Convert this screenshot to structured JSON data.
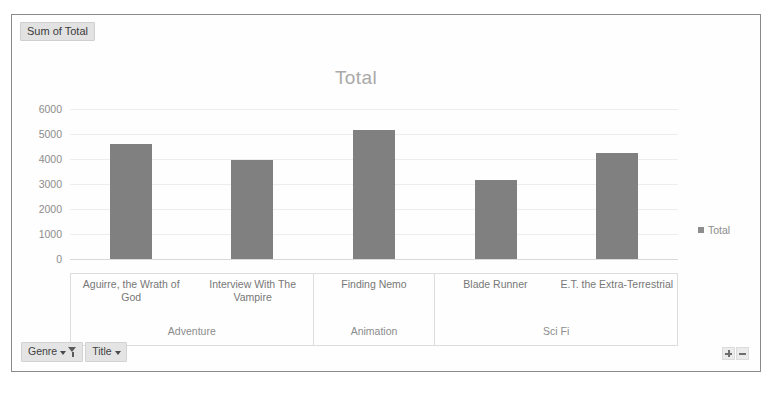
{
  "value_field_button": {
    "label": "Sum of Total"
  },
  "chart": {
    "title": "Total",
    "legend": {
      "entry": "Total",
      "marker_color": "#8d8d8d",
      "position": "right"
    }
  },
  "field_buttons": [
    {
      "label": "Genre",
      "has_caret": true,
      "has_filter": true,
      "icons": [
        "chevron-down-icon",
        "filter-funnel-icon"
      ]
    },
    {
      "label": "Title",
      "has_caret": true,
      "has_filter": false,
      "icons": [
        "chevron-down-icon"
      ]
    }
  ],
  "expand_collapse": [
    {
      "name": "expand-button",
      "glyph": "+"
    },
    {
      "name": "collapse-button",
      "glyph": "−"
    }
  ],
  "genre_groups": [
    {
      "label": "Adventure",
      "span": 2
    },
    {
      "label": "Animation",
      "span": 1
    },
    {
      "label": "Sci Fi",
      "span": 2
    }
  ],
  "chart_data": {
    "type": "bar",
    "title": "Total",
    "xlabel": "",
    "ylabel": "",
    "ylim": [
      0,
      6000
    ],
    "yticks": [
      0,
      1000,
      2000,
      3000,
      4000,
      5000,
      6000
    ],
    "ytick_labels": [
      "0",
      "1000",
      "2000",
      "3000",
      "4000",
      "5000",
      "6000"
    ],
    "grid": true,
    "bar_color": "#808080",
    "categories": [
      "Aguirre, the Wrath of God",
      "Interview With The Vampire",
      "Finding Nemo",
      "Blade Runner",
      "E.T. the Extra-Terrestrial"
    ],
    "group_labels": [
      "Adventure",
      "Adventure",
      "Animation",
      "Sci Fi",
      "Sci Fi"
    ],
    "series": [
      {
        "name": "Total",
        "values": [
          4600,
          3950,
          5150,
          3150,
          4250
        ]
      }
    ]
  }
}
